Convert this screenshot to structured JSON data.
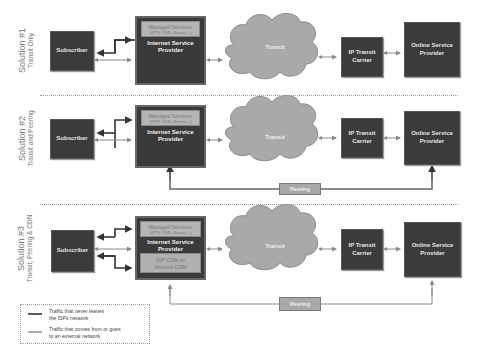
{
  "solutions": [
    {
      "title": "Solution #1",
      "subtitle": "Transit Only",
      "subscriber": "Subscriber",
      "isp": {
        "managed_title": "Managed Services",
        "managed_sub": "(IPTV, VOD, Games...)",
        "label_line1": "Internet Service",
        "label_line2": "Provider"
      },
      "cloud": "Transit",
      "carrier_line1": "IP Transit",
      "carrier_line2": "Carrier",
      "osp_line1": "Online Service",
      "osp_line2": "Provider"
    },
    {
      "title": "Solution #2",
      "subtitle": "Transit and Peering",
      "subscriber": "Subscriber",
      "isp": {
        "managed_title": "Managed Services",
        "managed_sub": "(IPTV, VOD, Games...)",
        "label_line1": "Internet Service",
        "label_line2": "Provider"
      },
      "cloud": "Transit",
      "carrier_line1": "IP Transit",
      "carrier_line2": "Carrier",
      "osp_line1": "Online Service",
      "osp_line2": "Provider",
      "peering": "Peering"
    },
    {
      "title": "Solution #3",
      "subtitle": "Transit, Peering & CDN",
      "subscriber": "Subscriber",
      "isp": {
        "managed_title": "Managed Services",
        "managed_sub": "(IPTV, VOD, Games...)",
        "label_line1": "Internet Service",
        "label_line2": "Provider",
        "cdn_line1": "ISP CDN or",
        "cdn_line2": "Hosted CDN"
      },
      "cloud": "Transit",
      "carrier_line1": "IP Transit",
      "carrier_line2": "Carrier",
      "osp_line1": "Online Service",
      "osp_line2": "Provider",
      "peering": "Peering"
    }
  ],
  "legend": {
    "item1_line1": "Traffic that never leaves",
    "item1_line2": "the ISPs network",
    "item2_line1": "Traffic that comes from or goes",
    "item2_line2": "to an external network"
  },
  "colors": {
    "dark_box": "#3b3b3b",
    "light_box": "#b5b5b5",
    "cloud": "#a9a9a9",
    "line_internal": "#333333",
    "line_external": "#888888"
  }
}
